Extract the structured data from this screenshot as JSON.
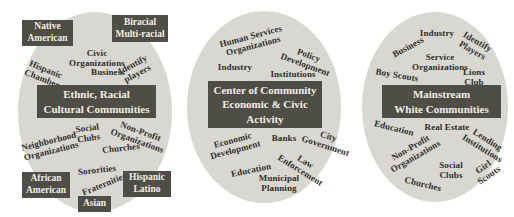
{
  "figure": {
    "background": "#ffffff",
    "ellipse_fill": "#d8d7d1",
    "box_fill": "#4e4d46",
    "box_text_color": "#f2efe6",
    "label_color": "#2f2e29"
  },
  "diagrams": [
    {
      "id": "ethnic-racial-cultural",
      "ellipse": {
        "cx": 95,
        "cy": 112,
        "rx": 77,
        "ry": 100
      },
      "center_box": {
        "text": "Ethnic, Racial\nCultural Communities",
        "x": 37,
        "y": 85,
        "w": 119,
        "h": 33
      },
      "corner_boxes": [
        {
          "text": "Native\nAmerican",
          "x": 22,
          "y": 20,
          "w": 51,
          "h": 26
        },
        {
          "text": "Biracial\nMulti-racial",
          "x": 112,
          "y": 15,
          "w": 56,
          "h": 27
        },
        {
          "text": "African\nAmerican",
          "x": 22,
          "y": 172,
          "w": 48,
          "h": 26
        },
        {
          "text": "Hispanic\nLatino",
          "x": 123,
          "y": 171,
          "w": 48,
          "h": 26
        },
        {
          "text": "Asian",
          "x": 78,
          "y": 196,
          "w": 33,
          "h": 16
        }
      ],
      "labels": [
        {
          "text": "Civic\nOrganizations",
          "x": 97,
          "y": 58,
          "rotate": 0
        },
        {
          "text": "Business",
          "x": 108,
          "y": 72,
          "rotate": 0
        },
        {
          "text": "Hispanic\nChamber",
          "x": 44,
          "y": 74,
          "rotate": 22
        },
        {
          "text": "Identify\nplayers",
          "x": 135,
          "y": 69,
          "rotate": -28
        },
        {
          "text": "Social\nClubs",
          "x": 88,
          "y": 133,
          "rotate": -8
        },
        {
          "text": "Non-Profit\nOrganizations",
          "x": 139,
          "y": 136,
          "rotate": 20
        },
        {
          "text": "Neighborhood\nOrganizations",
          "x": 50,
          "y": 146,
          "rotate": -14
        },
        {
          "text": "Churches",
          "x": 121,
          "y": 148,
          "rotate": -6
        },
        {
          "text": "Sororities",
          "x": 97,
          "y": 170,
          "rotate": -6
        },
        {
          "text": "Fraternities",
          "x": 104,
          "y": 184,
          "rotate": -22
        }
      ]
    },
    {
      "id": "center-of-community",
      "ellipse": {
        "cx": 264,
        "cy": 107,
        "rx": 77,
        "ry": 96
      },
      "center_box": {
        "text": "Center of Community\nEconomic & Civic\nActivity",
        "x": 208,
        "y": 81,
        "w": 114,
        "h": 47
      },
      "corner_boxes": [],
      "labels": [
        {
          "text": "Human Services\nOrganizations",
          "x": 252,
          "y": 41,
          "rotate": -15
        },
        {
          "text": "Policy\nDevelopment",
          "x": 307,
          "y": 60,
          "rotate": 20
        },
        {
          "text": "Industry",
          "x": 235,
          "y": 67,
          "rotate": 0
        },
        {
          "text": "Institutions",
          "x": 293,
          "y": 74,
          "rotate": 0
        },
        {
          "text": "Economic\nDevelopment",
          "x": 234,
          "y": 145,
          "rotate": -15
        },
        {
          "text": "Banks",
          "x": 284,
          "y": 138,
          "rotate": 0
        },
        {
          "text": "City\nGovernment",
          "x": 327,
          "y": 141,
          "rotate": 18
        },
        {
          "text": "Law\nEnforcement",
          "x": 303,
          "y": 166,
          "rotate": 32
        },
        {
          "text": "Education",
          "x": 251,
          "y": 170,
          "rotate": -12
        },
        {
          "text": "Municipal\nPlanning",
          "x": 279,
          "y": 183,
          "rotate": 0
        }
      ]
    },
    {
      "id": "mainstream-white",
      "ellipse": {
        "cx": 435,
        "cy": 107,
        "rx": 73,
        "ry": 95
      },
      "center_box": {
        "text": "Mainstream\nWhite Communities",
        "x": 382,
        "y": 85,
        "w": 119,
        "h": 33
      },
      "corner_boxes": [],
      "labels": [
        {
          "text": "Industry",
          "x": 437,
          "y": 33,
          "rotate": 0
        },
        {
          "text": "Business",
          "x": 408,
          "y": 47,
          "rotate": -28
        },
        {
          "text": "Identify\nPlayers",
          "x": 475,
          "y": 46,
          "rotate": 30
        },
        {
          "text": "Service\nOrganizations",
          "x": 440,
          "y": 62,
          "rotate": 0
        },
        {
          "text": "Boy Scouts",
          "x": 397,
          "y": 75,
          "rotate": 10
        },
        {
          "text": "Lions Club",
          "x": 474,
          "y": 77,
          "rotate": 0
        },
        {
          "text": "Education",
          "x": 394,
          "y": 128,
          "rotate": 14
        },
        {
          "text": "Real Estate",
          "x": 447,
          "y": 127,
          "rotate": 0
        },
        {
          "text": "Lending\nInstitutions",
          "x": 485,
          "y": 144,
          "rotate": 32
        },
        {
          "text": "Non-Profit\nOrganizations",
          "x": 413,
          "y": 152,
          "rotate": -30
        },
        {
          "text": "Social\nClubs",
          "x": 451,
          "y": 170,
          "rotate": 0
        },
        {
          "text": "Girl\nScouts",
          "x": 486,
          "y": 171,
          "rotate": -35
        },
        {
          "text": "Churches",
          "x": 423,
          "y": 184,
          "rotate": 14
        }
      ]
    }
  ]
}
